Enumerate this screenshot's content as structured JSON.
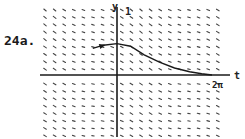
{
  "figure": {
    "problem_label": "24a.",
    "x_axis_label": "t",
    "y_axis_label": "y",
    "y_tick_label": "1",
    "x_tick_label": "2π",
    "colors": {
      "ink": "#1a1a1a",
      "marks": "#444444",
      "background": "#ffffff"
    }
  },
  "chart_data": {
    "type": "slope-field",
    "title": "24a.",
    "xlabel": "t",
    "ylabel": "y",
    "xlim": [
      -2.9,
      7.2
    ],
    "ylim": [
      -2.0,
      2.0
    ],
    "tick_labels": {
      "x": [
        "2π"
      ],
      "y": [
        "1"
      ]
    },
    "grid": false,
    "solution_curve": {
      "description": "solution curve with arrowhead, peaking near t=0 and decaying to the t-axis near t=2π",
      "points": [
        {
          "t": -1.6,
          "y": 0.83
        },
        {
          "t": -0.9,
          "y": 0.93
        },
        {
          "t": 0.0,
          "y": 0.98
        },
        {
          "t": 0.9,
          "y": 0.9
        },
        {
          "t": 1.8,
          "y": 0.63
        },
        {
          "t": 2.8,
          "y": 0.4
        },
        {
          "t": 3.8,
          "y": 0.22
        },
        {
          "t": 4.8,
          "y": 0.1
        },
        {
          "t": 5.6,
          "y": 0.04
        },
        {
          "t": 6.28,
          "y": 0.0
        }
      ]
    }
  }
}
